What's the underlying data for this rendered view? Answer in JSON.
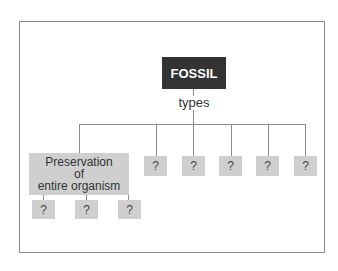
{
  "diagram": {
    "root": "FOSSIL",
    "edge_label": "types",
    "children": [
      {
        "label_lines": [
          "Preservation",
          "of",
          "entire organism"
        ],
        "children": [
          "?",
          "?",
          "?"
        ]
      },
      {
        "label": "?"
      },
      {
        "label": "?"
      },
      {
        "label": "?"
      },
      {
        "label": "?"
      },
      {
        "label": "?"
      }
    ]
  }
}
